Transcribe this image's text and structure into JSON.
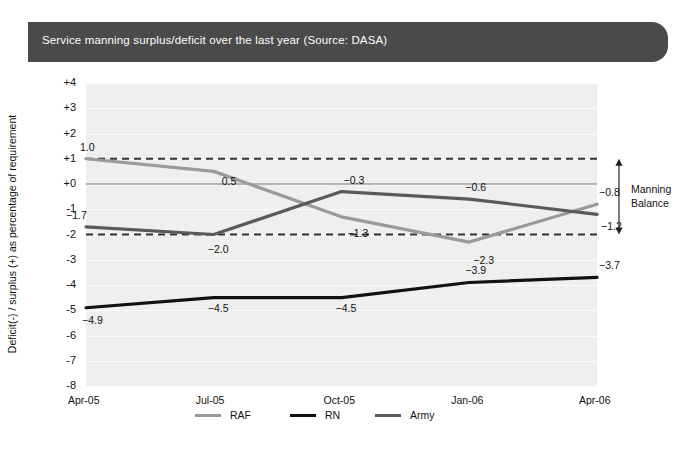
{
  "title": {
    "text": "Service manning surplus/deficit over the last year (Source: DASA)",
    "banner_color": "#4a4a4a",
    "text_color": "#ffffff"
  },
  "annotation": {
    "manning_balance_line1": "Manning",
    "manning_balance_line2": "Balance"
  },
  "legend": {
    "items": [
      {
        "label": "RAF",
        "color": "#9a9a9a"
      },
      {
        "label": "RN",
        "color": "#111111"
      },
      {
        "label": "Army",
        "color": "#5a5a5a"
      }
    ]
  },
  "chart_data": {
    "type": "line",
    "title": "Service manning surplus/deficit over the last year (Source: DASA)",
    "xlabel": "",
    "ylabel": "Deficit(-) / surplus (+) as percentage of requirement",
    "categories": [
      "Apr-05",
      "Jul-05",
      "Oct-05",
      "Jan-06",
      "Apr-06"
    ],
    "ylim": [
      -8,
      4
    ],
    "ytick_labels": [
      "+4",
      "+3",
      "+2",
      "+1",
      "+0",
      "-1",
      "-2",
      "-3",
      "-4",
      "-5",
      "-6",
      "-7",
      "-8"
    ],
    "ytick_values": [
      4,
      3,
      2,
      1,
      0,
      -1,
      -2,
      -3,
      -4,
      -5,
      -6,
      -7,
      -8
    ],
    "grid": true,
    "legend_position": "bottom",
    "reference_lines": [
      {
        "value": 1,
        "style": "dashed",
        "color": "#333333"
      },
      {
        "value": 0,
        "style": "solid",
        "color": "#777777"
      },
      {
        "value": -2,
        "style": "dashed",
        "color": "#333333"
      }
    ],
    "series": [
      {
        "name": "RAF",
        "color": "#9a9a9a",
        "values": [
          1.0,
          0.5,
          -1.3,
          -2.3,
          -0.8
        ],
        "labels": [
          "1.0",
          "0.5",
          "−1.3",
          "−2.3",
          "−0.8"
        ]
      },
      {
        "name": "RN",
        "color": "#111111",
        "values": [
          -4.9,
          -4.5,
          -4.5,
          -3.9,
          -3.7
        ],
        "labels": [
          "−4.9",
          "−4.5",
          "−4.5",
          "−3.9",
          "−3.7"
        ]
      },
      {
        "name": "Army",
        "color": "#5a5a5a",
        "values": [
          -1.7,
          -2.0,
          -0.3,
          -0.6,
          -1.2
        ],
        "labels": [
          "−1.7",
          "−2.0",
          "−0.3",
          "−0.6",
          "−1.2"
        ]
      }
    ],
    "annotations": [
      {
        "text": "Manning Balance",
        "from": 1,
        "to": -2
      }
    ]
  }
}
